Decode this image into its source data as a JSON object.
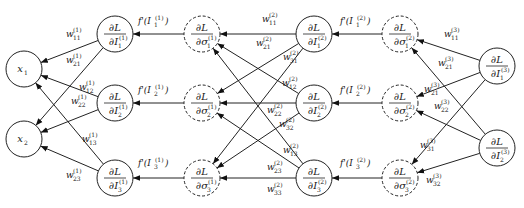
{
  "diagram": {
    "colors": {
      "stroke": "#222222",
      "background": "#ffffff"
    },
    "nodes": {
      "inputs": [
        {
          "id": "x1",
          "label": "x",
          "sub": "1",
          "cx": 24,
          "cy": 69,
          "r": 18,
          "style": "solid"
        },
        {
          "id": "x2",
          "label": "x",
          "sub": "2",
          "cx": 24,
          "cy": 139,
          "r": 18,
          "style": "solid"
        }
      ],
      "layer1_I": [
        {
          "id": "dL_dI1_1",
          "num": "∂L",
          "den": "∂I",
          "sub": "1",
          "sup": "(1)",
          "cx": 115,
          "cy": 34,
          "r": 18,
          "style": "solid"
        },
        {
          "id": "dL_dI2_1",
          "num": "∂L",
          "den": "∂I",
          "sub": "2",
          "sup": "(1)",
          "cx": 115,
          "cy": 103,
          "r": 18,
          "style": "solid"
        },
        {
          "id": "dL_dI3_1",
          "num": "∂L",
          "den": "∂I",
          "sub": "3",
          "sup": "(1)",
          "cx": 115,
          "cy": 178,
          "r": 18,
          "style": "solid"
        }
      ],
      "layer1_sigma": [
        {
          "id": "dL_dsig1_1",
          "num": "∂L",
          "den": "∂σ",
          "sub": "1",
          "sup": "(1)",
          "cx": 202,
          "cy": 34,
          "r": 18,
          "style": "dashed"
        },
        {
          "id": "dL_dsig2_1",
          "num": "∂L",
          "den": "∂σ",
          "sub": "2",
          "sup": "(1)",
          "cx": 202,
          "cy": 103,
          "r": 18,
          "style": "dashed"
        },
        {
          "id": "dL_dsig3_1",
          "num": "∂L",
          "den": "∂σ",
          "sub": "3",
          "sup": "(1)",
          "cx": 202,
          "cy": 178,
          "r": 18,
          "style": "dashed"
        }
      ],
      "layer2_I": [
        {
          "id": "dL_dI1_2",
          "num": "∂L",
          "den": "∂I",
          "sub": "1",
          "sup": "(2)",
          "cx": 314,
          "cy": 34,
          "r": 18,
          "style": "solid"
        },
        {
          "id": "dL_dI2_2",
          "num": "∂L",
          "den": "∂I",
          "sub": "2",
          "sup": "(2)",
          "cx": 314,
          "cy": 103,
          "r": 18,
          "style": "solid"
        },
        {
          "id": "dL_dI3_2",
          "num": "∂L",
          "den": "∂I",
          "sub": "3",
          "sup": "(2)",
          "cx": 314,
          "cy": 178,
          "r": 18,
          "style": "solid"
        }
      ],
      "layer2_sigma": [
        {
          "id": "dL_dsig1_2",
          "num": "∂L",
          "den": "∂σ",
          "sub": "1",
          "sup": "(2)",
          "cx": 400,
          "cy": 34,
          "r": 18,
          "style": "dashed"
        },
        {
          "id": "dL_dsig2_2",
          "num": "∂L",
          "den": "∂σ",
          "sub": "2",
          "sup": "(2)",
          "cx": 400,
          "cy": 103,
          "r": 18,
          "style": "dashed"
        },
        {
          "id": "dL_dsig3_2",
          "num": "∂L",
          "den": "∂σ",
          "sub": "3",
          "sup": "(2)",
          "cx": 400,
          "cy": 178,
          "r": 18,
          "style": "dashed"
        }
      ],
      "outputs": [
        {
          "id": "dL_dI1_3",
          "num": "∂L",
          "den": "∂I",
          "sub": "1",
          "sup": "(3)",
          "cx": 497,
          "cy": 66,
          "r": 18,
          "style": "solid"
        },
        {
          "id": "dL_dI2_3",
          "num": "∂L",
          "den": "∂I",
          "sub": "2",
          "sup": "(3)",
          "cx": 497,
          "cy": 148,
          "r": 18,
          "style": "solid"
        }
      ]
    },
    "activation_labels": [
      {
        "text": "f'(I",
        "sub": "1",
        "sup": "(1)",
        "x": 138,
        "y": 24
      },
      {
        "text": "f'(I",
        "sub": "2",
        "sup": "(1)",
        "x": 138,
        "y": 93
      },
      {
        "text": "f'(I",
        "sub": "3",
        "sup": "(1)",
        "x": 138,
        "y": 166
      },
      {
        "text": "f'(I",
        "sub": "1",
        "sup": "(2)",
        "x": 340,
        "y": 24
      },
      {
        "text": "f'(I",
        "sub": "2",
        "sup": "(2)",
        "x": 340,
        "y": 93
      },
      {
        "text": "f'(I",
        "sub": "3",
        "sup": "(2)",
        "x": 340,
        "y": 166
      }
    ],
    "weight_labels": {
      "layer1": [
        {
          "sub": "11",
          "sup": "(1)",
          "x": 66,
          "y": 37
        },
        {
          "sub": "21",
          "sup": "(1)",
          "x": 66,
          "y": 63
        },
        {
          "sub": "12",
          "sup": "(1)",
          "x": 79,
          "y": 90
        },
        {
          "sub": "22",
          "sup": "(1)",
          "x": 71,
          "y": 104
        },
        {
          "sub": "13",
          "sup": "(1)",
          "x": 82,
          "y": 142
        },
        {
          "sub": "23",
          "sup": "(1)",
          "x": 66,
          "y": 178
        }
      ],
      "layer2": [
        {
          "sub": "11",
          "sup": "(2)",
          "x": 262,
          "y": 22
        },
        {
          "sub": "21",
          "sup": "(2)",
          "x": 256,
          "y": 46
        },
        {
          "sub": "31",
          "sup": "(2)",
          "x": 283,
          "y": 60
        },
        {
          "sub": "12",
          "sup": "(2)",
          "x": 282,
          "y": 86
        },
        {
          "sub": "22",
          "sup": "(2)",
          "x": 267,
          "y": 113
        },
        {
          "sub": "32",
          "sup": "(2)",
          "x": 279,
          "y": 127
        },
        {
          "sub": "13",
          "sup": "(2)",
          "x": 283,
          "y": 153
        },
        {
          "sub": "23",
          "sup": "(2)",
          "x": 267,
          "y": 170
        },
        {
          "sub": "33",
          "sup": "(2)",
          "x": 267,
          "y": 192
        }
      ],
      "layer3": [
        {
          "sub": "11",
          "sup": "(3)",
          "x": 444,
          "y": 37
        },
        {
          "sub": "21",
          "sup": "(3)",
          "x": 438,
          "y": 66
        },
        {
          "sub": "21",
          "sup": "(3)",
          "x": 424,
          "y": 92
        },
        {
          "sub": "22",
          "sup": "(3)",
          "x": 434,
          "y": 109
        },
        {
          "sub": "31",
          "sup": "(3)",
          "x": 420,
          "y": 148
        },
        {
          "sub": "32",
          "sup": "(3)",
          "x": 426,
          "y": 183
        }
      ]
    }
  }
}
